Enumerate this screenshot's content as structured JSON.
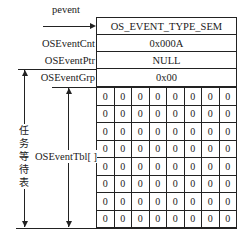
{
  "diagram": {
    "pointer_label": "pevent",
    "fields": [
      {
        "name": "OSEventType_hidden",
        "label": "",
        "value": "OS_EVENT_TYPE_SEM"
      },
      {
        "name": "OSEventCnt",
        "label": "OSEventCnt",
        "value": "0x000A"
      },
      {
        "name": "OSEventPtr",
        "label": "OSEventPtr",
        "value": "NULL"
      },
      {
        "name": "OSEventGrp",
        "label": "OSEventGrp",
        "value": "0x00"
      }
    ],
    "table_label": "OSEventTbl[ ]",
    "wait_list_label": "任务等待表",
    "wait_list_chars": [
      "任",
      "务",
      "等",
      "待",
      "表"
    ],
    "grid": [
      [
        "0",
        "0",
        "0",
        "0",
        "0",
        "0",
        "0",
        "0"
      ],
      [
        "0",
        "0",
        "0",
        "0",
        "0",
        "0",
        "0",
        "0"
      ],
      [
        "0",
        "0",
        "0",
        "0",
        "0",
        "0",
        "0",
        "0"
      ],
      [
        "0",
        "0",
        "0",
        "0",
        "0",
        "0",
        "0",
        "0"
      ],
      [
        "0",
        "0",
        "0",
        "0",
        "0",
        "0",
        "0",
        "0"
      ],
      [
        "0",
        "0",
        "0",
        "0",
        "0",
        "0",
        "0",
        "0"
      ],
      [
        "0",
        "0",
        "0",
        "0",
        "0",
        "0",
        "0",
        "0"
      ],
      [
        "0",
        "0",
        "0",
        "0",
        "0",
        "0",
        "0",
        "0"
      ]
    ]
  }
}
